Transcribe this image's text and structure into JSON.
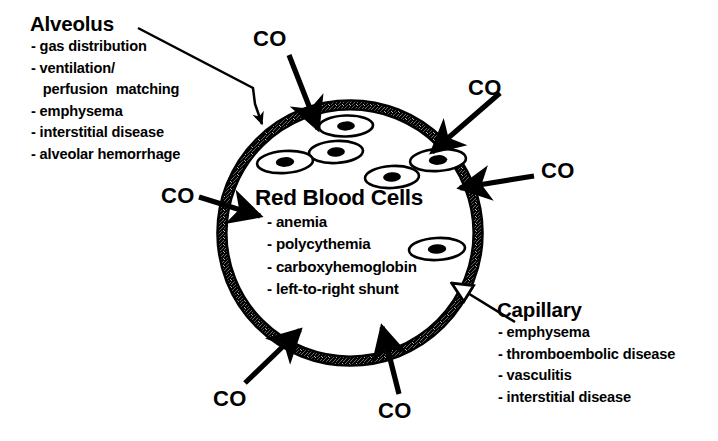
{
  "figure": {
    "background_color": "#ffffff",
    "ink_color": "#000000"
  },
  "alveolus": {
    "title": "Alveolus",
    "items": [
      "- gas distribution",
      "- ventilation/",
      "   perfusion  matching",
      "- emphysema",
      "- interstitial disease",
      "- alveolar hemorrhage"
    ]
  },
  "capillary": {
    "title": "Capillary",
    "items": [
      "- emphysema",
      "- thromboembolic disease",
      "- vasculitis",
      "- interstitial disease"
    ]
  },
  "red_blood_cells": {
    "title": "Red Blood Cells",
    "items": [
      "- anemia",
      "- polycythemia",
      "- carboxyhemoglobin",
      "- left-to-right shunt"
    ]
  },
  "co_labels": [
    {
      "id": "co-top",
      "text": "CO",
      "x": 253,
      "y": 28
    },
    {
      "id": "co-top-right",
      "text": "CO",
      "x": 468,
      "y": 77
    },
    {
      "id": "co-right",
      "text": "CO",
      "x": 541,
      "y": 160
    },
    {
      "id": "co-left",
      "text": "CO",
      "x": 161,
      "y": 185
    },
    {
      "id": "co-bottom-left",
      "text": "CO",
      "x": 213,
      "y": 388
    },
    {
      "id": "co-bottom",
      "text": "CO",
      "x": 378,
      "y": 400
    }
  ],
  "circle": {
    "center_x": 350,
    "center_y": 233,
    "radius": 128,
    "wall_label": "alveolar-capillary membrane"
  },
  "red_blood_cell_positions": [
    {
      "cx": 346,
      "cy": 126,
      "rx": 27,
      "ry": 10.5,
      "rot": -2
    },
    {
      "cx": 336,
      "cy": 152,
      "rx": 27,
      "ry": 11,
      "rot": -3
    },
    {
      "cx": 285,
      "cy": 162,
      "rx": 28,
      "ry": 11,
      "rot": -4
    },
    {
      "cx": 438,
      "cy": 160,
      "rx": 28,
      "ry": 11,
      "rot": -4
    },
    {
      "cx": 392,
      "cy": 177,
      "rx": 27,
      "ry": 11,
      "rot": -3
    },
    {
      "cx": 437,
      "cy": 249,
      "rx": 28,
      "ry": 11,
      "rot": -3
    }
  ],
  "arrows": [
    {
      "id": "arrow-co-top",
      "from": [
        289,
        55
      ],
      "to": [
        318,
        129
      ],
      "kind": "solid"
    },
    {
      "id": "arrow-co-top-right",
      "from": [
        500,
        93
      ],
      "to": [
        432,
        152
      ],
      "kind": "solid"
    },
    {
      "id": "arrow-co-right",
      "from": [
        534,
        176
      ],
      "to": [
        460,
        188
      ],
      "kind": "solid"
    },
    {
      "id": "arrow-co-left",
      "from": [
        199,
        197
      ],
      "to": [
        260,
        216
      ],
      "kind": "solid"
    },
    {
      "id": "arrow-co-bottom-left",
      "from": [
        245,
        383
      ],
      "to": [
        300,
        330
      ],
      "kind": "solid"
    },
    {
      "id": "arrow-co-bottom",
      "from": [
        399,
        394
      ],
      "to": [
        382,
        327
      ],
      "kind": "solid"
    },
    {
      "id": "arrow-alveolus-leader",
      "kind": "leader",
      "points": "138,28 253,88 255,104 262,124"
    },
    {
      "id": "arrow-capillary-leader",
      "kind": "hollow",
      "from": [
        515,
        322
      ],
      "to": [
        453,
        284
      ]
    }
  ]
}
